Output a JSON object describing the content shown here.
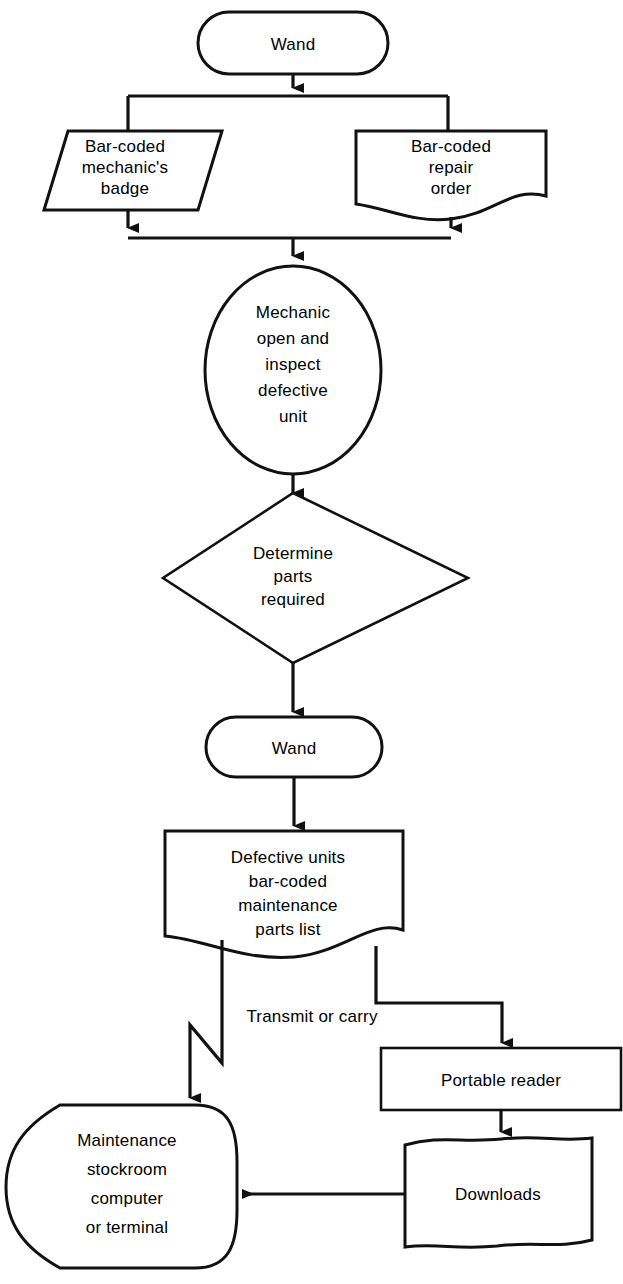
{
  "diagram": {
    "background_color": "#ffffff",
    "line_color": "#111111",
    "nodes": {
      "wand_top": {
        "shape": "rounded-terminator",
        "label": "Wand"
      },
      "badge": {
        "shape": "parallelogram",
        "label_line1": "Bar-coded",
        "label_line2": "mechanic's",
        "label_line3": "badge"
      },
      "repair_order": {
        "shape": "document",
        "label_line1": "Bar-coded",
        "label_line2": "repair",
        "label_line3": "order"
      },
      "mechanic": {
        "shape": "circle",
        "label_line1": "Mechanic",
        "label_line2": "open and",
        "label_line3": "inspect",
        "label_line4": "defective",
        "label_line5": "unit"
      },
      "determine": {
        "shape": "diamond",
        "label_line1": "Determine",
        "label_line2": "parts",
        "label_line3": "required"
      },
      "wand_second": {
        "shape": "rounded-terminator",
        "label": "Wand"
      },
      "parts_list": {
        "shape": "document",
        "label_line1": "Defective units",
        "label_line2": "bar-coded",
        "label_line3": "maintenance",
        "label_line4": "parts list"
      },
      "portable_reader": {
        "shape": "rectangle",
        "label": "Portable reader"
      },
      "downloads": {
        "shape": "multi-document",
        "label": "Downloads"
      },
      "stockroom": {
        "shape": "storage",
        "label_line1": "Maintenance",
        "label_line2": "stockroom",
        "label_line3": "computer",
        "label_line4": "or  terminal"
      }
    },
    "edge_labels": {
      "transmit": "Transmit or carry"
    }
  }
}
